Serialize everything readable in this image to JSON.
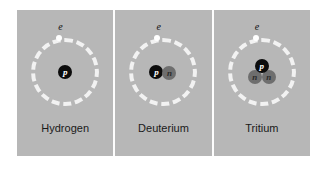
{
  "figure": {
    "background_color": "#ffffff",
    "plate_color": "#b7b7b7",
    "divider_color": "#fdfdfd",
    "orbit_color": "#f2f2f2",
    "proton_color": "#0c0c0c",
    "neutron_color": "#6e6e6e",
    "electron_color": "#ffffff"
  },
  "panels": [
    {
      "caption": "Hydrogen",
      "electron_label": "e",
      "particles": [
        {
          "symbol": "p",
          "kind": "proton"
        }
      ]
    },
    {
      "caption": "Deuterium",
      "electron_label": "e",
      "particles": [
        {
          "symbol": "p",
          "kind": "proton"
        },
        {
          "symbol": "n",
          "kind": "neutron"
        }
      ]
    },
    {
      "caption": "Tritium",
      "electron_label": "e",
      "particles": [
        {
          "symbol": "p",
          "kind": "proton"
        },
        {
          "symbol": "n",
          "kind": "neutron"
        },
        {
          "symbol": "n",
          "kind": "neutron"
        }
      ]
    }
  ]
}
